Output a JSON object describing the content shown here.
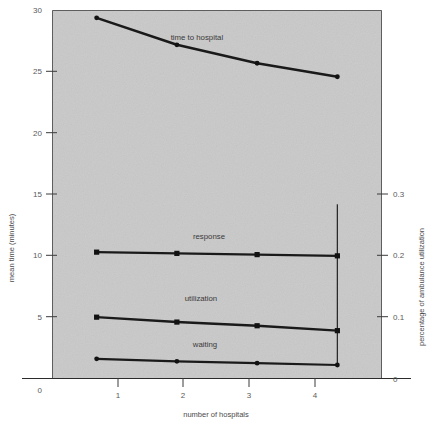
{
  "chart_data": {
    "type": "line",
    "title": "",
    "xlabel": "number of hospitals",
    "ylabel": "mean time (minutes)",
    "y2label": "percentage of ambulance utilization",
    "x": [
      1,
      2,
      3,
      4
    ],
    "xlim": [
      0.45,
      4.55
    ],
    "ylim": [
      0,
      30
    ],
    "y2lim": [
      0,
      0.3
    ],
    "grid": false,
    "legend_position": "inline-annotations",
    "xticks": [
      "1",
      "2",
      "3",
      "4"
    ],
    "yticks": [
      "0",
      "5",
      "10",
      "15",
      "20",
      "25",
      "30"
    ],
    "y2ticks": [
      "0",
      "0.1",
      "0.2",
      "0.3"
    ],
    "origin_label": "0",
    "series": [
      {
        "name": "time to hospital",
        "label": "time to hospital",
        "axis": "left",
        "values": [
          29.4,
          27.2,
          25.7,
          24.6
        ],
        "marker": "circle",
        "label_x": 2.25,
        "label_y": 27.6
      },
      {
        "name": "response",
        "label": "response",
        "axis": "left",
        "values": [
          10.3,
          10.2,
          10.1,
          10.0
        ],
        "marker": "square",
        "label_x": 2.4,
        "label_y": 11.4
      },
      {
        "name": "utilization",
        "label": "utilization",
        "axis": "left",
        "values": [
          5.0,
          4.6,
          4.3,
          3.9
        ],
        "marker": "square",
        "label_x": 2.3,
        "label_y": 6.3
      },
      {
        "name": "waiting",
        "label": "waiting",
        "axis": "left",
        "values": [
          1.6,
          1.4,
          1.25,
          1.1
        ],
        "marker": "circle",
        "label_x": 2.35,
        "label_y": 2.6
      }
    ],
    "annotations": [
      {
        "name": "vertical-marker-at-4",
        "type": "vline",
        "x": 4,
        "y_from": 1.1,
        "y_to": 14.2
      }
    ],
    "colors": {
      "plot_background": "#c9c9c9",
      "page_background": "#ffffff",
      "line": "#1a1a1a",
      "axis": "#2b2b2b",
      "text": "#4a4a4a"
    }
  }
}
